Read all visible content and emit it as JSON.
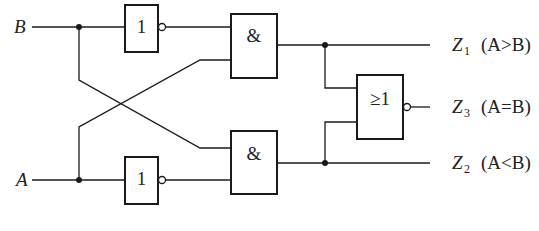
{
  "diagram": {
    "type": "logic-circuit",
    "inputs": [
      {
        "name": "B"
      },
      {
        "name": "A"
      }
    ],
    "gates": [
      {
        "id": "not_b",
        "type": "NOT",
        "symbol": "1"
      },
      {
        "id": "not_a",
        "type": "NOT",
        "symbol": "1"
      },
      {
        "id": "and_top",
        "type": "AND",
        "symbol": "&"
      },
      {
        "id": "and_bottom",
        "type": "AND",
        "symbol": "&"
      },
      {
        "id": "nor",
        "type": "NOR",
        "symbol": "≥1"
      }
    ],
    "outputs": [
      {
        "name": "Z",
        "sub": "1",
        "condition": "(A>B)"
      },
      {
        "name": "Z",
        "sub": "3",
        "condition": "(A=B)"
      },
      {
        "name": "Z",
        "sub": "2",
        "condition": "(A<B)"
      }
    ]
  }
}
